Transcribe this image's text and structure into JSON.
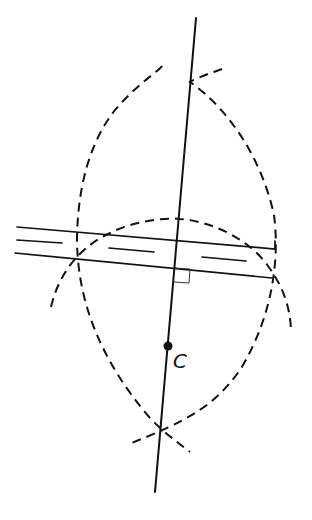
{
  "diagram": {
    "colors": {
      "stroke": "#111111",
      "background": "#ffffff"
    },
    "point_label": "C",
    "elements": [
      {
        "type": "solid-line",
        "name": "perpendicular-line",
        "from": [
          196,
          18
        ],
        "to": [
          155,
          492
        ]
      },
      {
        "type": "solid-line",
        "name": "parallel-line-upper",
        "from": [
          17,
          227
        ],
        "to": [
          275,
          249
        ]
      },
      {
        "type": "solid-line",
        "name": "parallel-line-lower",
        "from": [
          15,
          253
        ],
        "to": [
          272,
          278
        ]
      },
      {
        "type": "dashed-line",
        "name": "center-dashes",
        "segments": 3
      },
      {
        "type": "dashed-arc",
        "name": "large-arc-left"
      },
      {
        "type": "dashed-arc",
        "name": "large-arc-right"
      },
      {
        "type": "dashed-arc",
        "name": "small-arc-top"
      },
      {
        "type": "intersection",
        "name": "top-intersection",
        "at": [
          191,
          80
        ]
      },
      {
        "type": "intersection",
        "name": "bottom-intersection",
        "at": [
          161,
          430
        ]
      },
      {
        "type": "point",
        "name": "point-c",
        "at": [
          168,
          346
        ]
      },
      {
        "type": "right-angle-marker",
        "at": [
          175,
          268
        ]
      }
    ]
  }
}
